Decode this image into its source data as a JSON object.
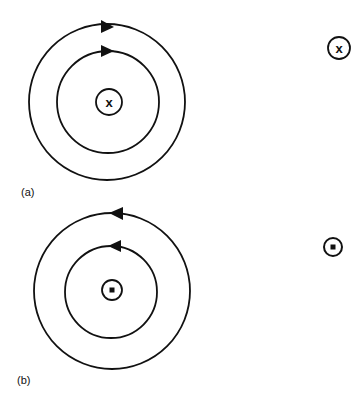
{
  "panels": [
    {
      "id": "a",
      "label": "(a)",
      "direction": "clockwise",
      "center_symbol": "x",
      "center_symbol_meaning": "into page",
      "side_symbol": "x"
    },
    {
      "id": "b",
      "label": "(b)",
      "direction": "counterclockwise",
      "center_symbol": "dot",
      "center_symbol_meaning": "out of page",
      "side_symbol": "dot"
    }
  ],
  "symbols": {
    "x_glyph": "x"
  },
  "colors": {
    "stroke": "#111111",
    "background": "#ffffff"
  }
}
